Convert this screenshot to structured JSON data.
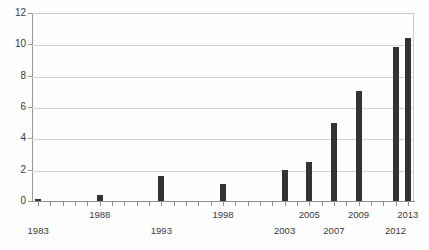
{
  "chart_data": {
    "type": "bar",
    "title": "",
    "xlabel": "",
    "ylabel": "",
    "ylim": [
      0,
      12
    ],
    "xlim": [
      1982.5,
      2013.5
    ],
    "ytick_values": [
      0,
      2,
      4,
      6,
      8,
      10,
      12
    ],
    "ytick_labels": [
      "0",
      "2",
      "4",
      "6",
      "8",
      "10",
      "12"
    ],
    "grid": "horizontal",
    "legend": "none",
    "bar_color": "#333333",
    "gridline_color": "#d2d2d2",
    "axis_color": "#8f8f8f",
    "xtick_labels": [
      {
        "year": 1983,
        "label": "1983",
        "row": "lower"
      },
      {
        "year": 1988,
        "label": "1988",
        "row": "upper"
      },
      {
        "year": 1993,
        "label": "1993",
        "row": "lower"
      },
      {
        "year": 1998,
        "label": "1998",
        "row": "upper"
      },
      {
        "year": 2003,
        "label": "2003",
        "row": "lower"
      },
      {
        "year": 2005,
        "label": "2005",
        "row": "upper"
      },
      {
        "year": 2007,
        "label": "2007",
        "row": "lower"
      },
      {
        "year": 2009,
        "label": "2009",
        "row": "upper"
      },
      {
        "year": 2012,
        "label": "2012",
        "row": "lower"
      },
      {
        "year": 2013,
        "label": "2013",
        "row": "upper"
      }
    ],
    "categories": [
      1983,
      1984,
      1985,
      1986,
      1987,
      1988,
      1989,
      1990,
      1991,
      1992,
      1993,
      1994,
      1995,
      1996,
      1997,
      1998,
      1999,
      2000,
      2001,
      2002,
      2003,
      2004,
      2005,
      2006,
      2007,
      2008,
      2009,
      2010,
      2011,
      2012,
      2013
    ],
    "values": [
      0.1,
      0,
      0,
      0,
      0,
      0.4,
      0,
      0,
      0,
      0,
      1.6,
      0,
      0,
      0,
      0,
      1.1,
      0,
      0,
      0,
      0,
      2.0,
      0,
      2.5,
      0,
      5.0,
      0,
      7.0,
      0,
      0,
      9.8,
      10.4
    ]
  }
}
